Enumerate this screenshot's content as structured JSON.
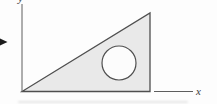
{
  "figure": {
    "colors": {
      "background": "#fdfdfd",
      "shape_stroke": "#4f4f4f",
      "shape_fill": "#e9e9e9",
      "circle_fill": "#fcfcfc",
      "axis_stroke": "#5e5e5e",
      "arrow_fill": "#1c1c1c",
      "label_color": "#3c3c3c"
    },
    "axes": {
      "y_axis": {
        "x1": "22",
        "y1": "4",
        "x2": "22",
        "y2": "91.5",
        "stroke_width": "1",
        "label": "y",
        "label_x": "18",
        "label_y": "2"
      },
      "x_axis": {
        "x1": "154",
        "y1": "91.5",
        "x2": "193",
        "y2": "91.5",
        "stroke_width": "1",
        "label": "x",
        "label_x": "196",
        "label_y": "95"
      }
    },
    "triangle": {
      "points": "22,91.5 150,91.5 150,13",
      "stroke_width": "1.3"
    },
    "circle": {
      "cx": "119",
      "cy": "63",
      "r": "17",
      "stroke_width": "1.2"
    },
    "pointer_arrow": {
      "points": "0,38.5 7.5,42 0,45.5"
    }
  }
}
